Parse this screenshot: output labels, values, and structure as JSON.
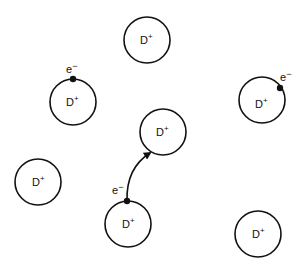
{
  "diagram": {
    "ion_label": "D",
    "ion_charge": "+",
    "electron_label": "e",
    "electron_charge": "−",
    "stroke_color": "#111111",
    "background": "#ffffff",
    "ions": [
      {
        "id": "ion-top",
        "cx": 147,
        "cy": 40,
        "r": 23,
        "has_electron": false
      },
      {
        "id": "ion-left-upper",
        "cx": 73,
        "cy": 102,
        "r": 23,
        "has_electron": true,
        "electron_pos": "top"
      },
      {
        "id": "ion-right",
        "cx": 262,
        "cy": 100,
        "r": 23,
        "has_electron": true,
        "electron_pos": "upper-right"
      },
      {
        "id": "ion-center",
        "cx": 163,
        "cy": 132,
        "r": 23,
        "has_electron": false
      },
      {
        "id": "ion-left-lower",
        "cx": 38,
        "cy": 182,
        "r": 23,
        "has_electron": false
      },
      {
        "id": "ion-bottom-center",
        "cx": 128,
        "cy": 224,
        "r": 23,
        "has_electron": true,
        "electron_pos": "top",
        "hopping": true
      },
      {
        "id": "ion-bottom-right",
        "cx": 258,
        "cy": 234,
        "r": 23,
        "has_electron": false
      }
    ],
    "transition": {
      "from": "ion-bottom-center",
      "to": "ion-center",
      "label": "e−"
    }
  }
}
